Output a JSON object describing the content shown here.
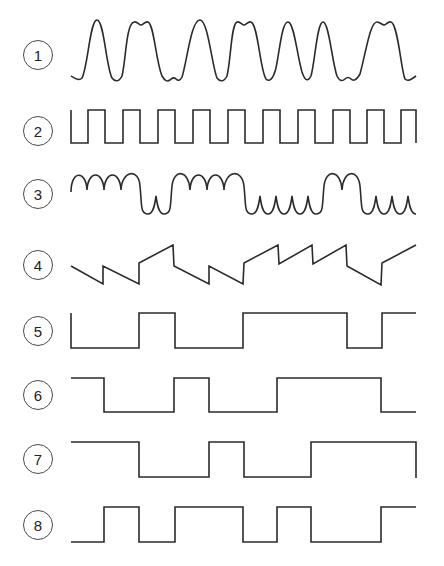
{
  "figure": {
    "stroke_color": "#2b2b2b",
    "background": "#ffffff",
    "waveforms": [
      {
        "label": "1",
        "type": "smoothed-analog",
        "description": "filtered bit stream (rounded pulses)"
      },
      {
        "label": "2",
        "type": "clock",
        "description": "square wave, 10 cycles"
      },
      {
        "label": "3",
        "type": "scalloped",
        "description": "biphase-like arched waveform"
      },
      {
        "label": "4",
        "type": "sawtooth-steps",
        "description": "stepped sawtooth"
      },
      {
        "label": "5",
        "type": "digital",
        "bits": [
          0,
          0,
          1,
          0,
          0,
          1,
          1,
          1,
          0,
          1
        ]
      },
      {
        "label": "6",
        "type": "digital",
        "bits": [
          1,
          0,
          0,
          1,
          0,
          0,
          1,
          1,
          1,
          0
        ]
      },
      {
        "label": "7",
        "type": "digital",
        "bits": [
          1,
          1,
          0,
          0,
          1,
          0,
          0,
          1,
          1,
          1
        ]
      },
      {
        "label": "8",
        "type": "digital",
        "bits": [
          0,
          1,
          0,
          1,
          1,
          0,
          1,
          0,
          0,
          1
        ]
      }
    ]
  }
}
